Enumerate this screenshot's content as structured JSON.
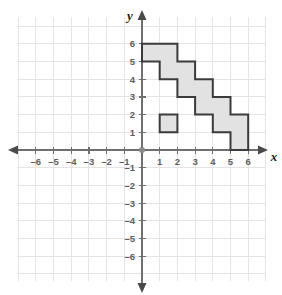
{
  "figure": {
    "axis_labels": {
      "x": "x",
      "y": "y"
    },
    "colors": {
      "grid": "#e4e4e4",
      "axis": "#6f6f6f",
      "tick_label": "#5d5d5d",
      "shape_fill": "#e2e2e2",
      "shape_stroke": "#3b3b3b",
      "background": "#ffffff"
    }
  },
  "chart_data": {
    "type": "scatter",
    "title": "",
    "subtitle": "",
    "xlabel": "x",
    "ylabel": "y",
    "xlim": [
      -6.8,
      6.8
    ],
    "ylim": [
      -6.8,
      6.8
    ],
    "grid": true,
    "legend": "none",
    "x_ticks": [
      -6,
      -5,
      -4,
      -3,
      -2,
      -1,
      1,
      2,
      3,
      4,
      5,
      6
    ],
    "y_ticks": [
      6,
      5,
      4,
      3,
      2,
      1,
      -1,
      -2,
      -3,
      -4,
      -5,
      -6
    ],
    "x_tick_labels": [
      "–6",
      "–5",
      "–4",
      "–3",
      "–2",
      "–1",
      "1",
      "2",
      "3",
      "4",
      "5",
      "6"
    ],
    "y_tick_labels": [
      "6",
      "5",
      "4",
      "3",
      "2",
      "1",
      "–1",
      "–2",
      "–3",
      "–4",
      "–5",
      "–6"
    ],
    "origin_label": "0",
    "shapes": [
      {
        "name": "stair-step-polygon",
        "kind": "polygon",
        "fill": "#e2e2e2",
        "stroke": "#3b3b3b",
        "points": [
          [
            0,
            6
          ],
          [
            2,
            6
          ],
          [
            2,
            5
          ],
          [
            3,
            5
          ],
          [
            3,
            4
          ],
          [
            4,
            4
          ],
          [
            4,
            3
          ],
          [
            5,
            3
          ],
          [
            5,
            2
          ],
          [
            6,
            2
          ],
          [
            6,
            0
          ],
          [
            5,
            0
          ],
          [
            5,
            1
          ],
          [
            4,
            1
          ],
          [
            4,
            2
          ],
          [
            3,
            2
          ],
          [
            3,
            3
          ],
          [
            2,
            3
          ],
          [
            2,
            4
          ],
          [
            1,
            4
          ],
          [
            1,
            5
          ],
          [
            0,
            5
          ]
        ]
      },
      {
        "name": "unit-square",
        "kind": "polygon",
        "fill": "#e2e2e2",
        "stroke": "#3b3b3b",
        "points": [
          [
            1,
            1
          ],
          [
            2,
            1
          ],
          [
            2,
            2
          ],
          [
            1,
            2
          ]
        ]
      }
    ],
    "annotations": []
  }
}
